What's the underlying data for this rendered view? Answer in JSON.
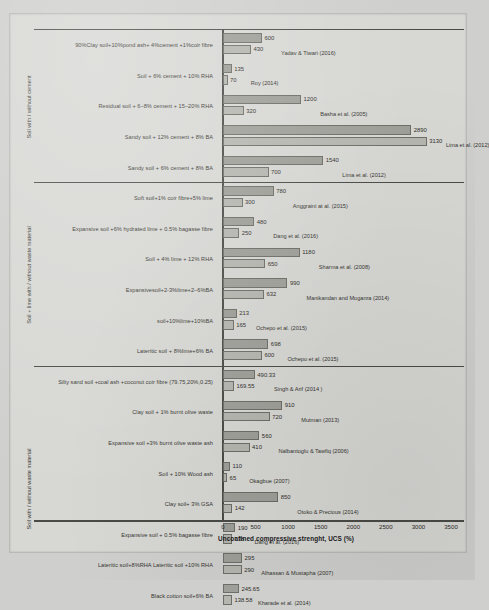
{
  "chart_data": {
    "type": "bar",
    "orientation": "horizontal",
    "title": "",
    "xlabel": "Unconfined compressive strenght, UCS (%)",
    "ylabel": "",
    "xlim": [
      0,
      3500
    ],
    "xticks": [
      0,
      500,
      1000,
      1500,
      2000,
      2500,
      3000,
      3500
    ],
    "grid": false,
    "legend_position": "none",
    "series": [
      {
        "name": "upper-bar",
        "color": "#9f9f99"
      },
      {
        "name": "lower-bar",
        "color": "#b6b6b0"
      }
    ],
    "groups": [
      {
        "label": "Soil with / without cement",
        "rows": [
          {
            "category": "90%Clay soil+10%pond ash+ 4%cement +1%coir fibre",
            "v1": 600,
            "v2": 430,
            "citation": "Yadav & Tiwari (2016)"
          },
          {
            "category": "Soil + 6% cement + 10% RHA",
            "v1": 135,
            "v2": 70,
            "citation": "Roy (2014)"
          },
          {
            "category": "Residual soil + 6–8% cement + 15–20% RHA",
            "v1": 1200,
            "v2": 320,
            "citation": "Basha et al. (2005)"
          },
          {
            "category": "Sandy soil + 12% cement + 8% BA",
            "v1": 2890,
            "v2": 3130,
            "citation": "Lima et al. (2012)"
          },
          {
            "category": "Sandy soil + 6% cement + 8% BA",
            "v1": 1540,
            "v2": 700,
            "citation": "Lima et al. (2012)"
          }
        ]
      },
      {
        "label": "Soil + lime with / without waste material",
        "rows": [
          {
            "category": "Soft soil+1% coir fibre+5% lime",
            "v1": 780,
            "v2": 300,
            "citation": "Anggraini at al. (2015)"
          },
          {
            "category": "Expansive soil +6% hydrated lime + 0.5% bagasse fibre",
            "v1": 480,
            "v2": 250,
            "citation": "Dang et al. (2016)"
          },
          {
            "category": "Soil + 4% lime + 12% RHA",
            "v1": 1180,
            "v2": 650,
            "citation": "Sharma et al. (2008)"
          },
          {
            "category": "Expansivesoil+2-3%lime+2–6%BA",
            "v1": 990,
            "v2": 632,
            "citation": "Manikandan and Moganra (2014)"
          },
          {
            "category": "soil+10%lime+10%BA",
            "v1": 213,
            "v2": 165,
            "citation": "Ochepo et al. (2015)"
          },
          {
            "category": "Lateritic soil + 8%lime+6% BA",
            "v1": 698,
            "v2": 600,
            "citation": "Ochepo et al. (2015)"
          }
        ]
      },
      {
        "label": "Soil with / without waste material",
        "rows": [
          {
            "category": "Silty sand soil +coal ash +coconut coir fibre (79.75,20%,0.25)",
            "v1": 490.33,
            "v2": 169.55,
            "citation": "Singh & Arif (2014 )"
          },
          {
            "category": "Clay soil + 1% burnt olive waste",
            "v1": 910,
            "v2": 720,
            "citation": "Mutman (2013)"
          },
          {
            "category": "Expansive soil +3% burnt olive waste ash",
            "v1": 560,
            "v2": 410,
            "citation": "Nalbantoglu & Tawfiq (2006)"
          },
          {
            "category": "Soil + 10% Wood ash",
            "v1": 110,
            "v2": 65,
            "citation": "Okagbue (2007)"
          },
          {
            "category": "Clay soil+ 3% GSA",
            "v1": 850,
            "v2": 142,
            "citation": "Otoko & Precious (2014)"
          },
          {
            "category": "Expansive soil + 0.5% bagasse fibre",
            "v1": 190,
            "v2": 138,
            "citation": "Dang et al. (2016)"
          },
          {
            "category": "Lateritic soil+8%RHA Lateritic soil +10% RHA",
            "v1": 295,
            "v2": 290,
            "citation": "Alhassan & Mustapha (2007)"
          },
          {
            "category": "Black cotton soil+6% BA",
            "v1": 245.65,
            "v2": 138.58,
            "citation": "Kharade et al. (2014)"
          }
        ]
      }
    ]
  }
}
